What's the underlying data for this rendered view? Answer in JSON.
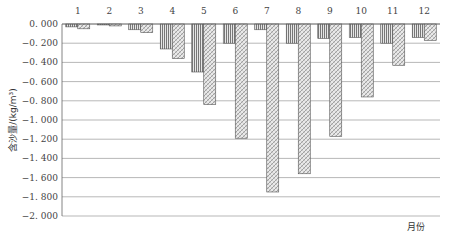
{
  "chart_data": {
    "type": "bar",
    "title": "",
    "xlabel": "月份",
    "ylabel": "含沙量/(kg/m³)",
    "x_axis_position": "top",
    "categories": [
      "1",
      "2",
      "3",
      "4",
      "5",
      "6",
      "7",
      "8",
      "9",
      "10",
      "11",
      "12"
    ],
    "series": [
      {
        "name": "series-1",
        "pattern": "vertical-stripes",
        "values": [
          -0.03,
          -0.01,
          -0.06,
          -0.26,
          -0.5,
          -0.2,
          -0.06,
          -0.2,
          -0.15,
          -0.14,
          -0.2,
          -0.14
        ]
      },
      {
        "name": "series-2",
        "pattern": "diagonal-hatch",
        "values": [
          -0.05,
          -0.02,
          -0.09,
          -0.36,
          -0.84,
          -1.19,
          -1.75,
          -1.56,
          -1.17,
          -0.76,
          -0.43,
          -0.17
        ]
      }
    ],
    "ylim": [
      -2.0,
      0.0
    ],
    "y_ticks": [
      "0.000",
      "-0.200",
      "-0.400",
      "-0.600",
      "-0.800",
      "-1.000",
      "-1.200",
      "-1.400",
      "-1.600",
      "-1.800",
      "-2.000"
    ],
    "grid": true,
    "legend": null
  }
}
